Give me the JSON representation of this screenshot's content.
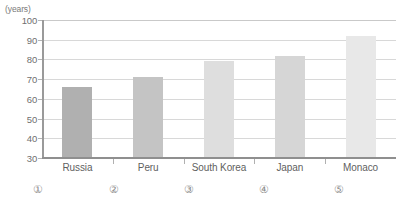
{
  "chart_data": {
    "type": "bar",
    "title": "",
    "xlabel": "",
    "ylabel": "",
    "unit_label": "(years)",
    "categories": [
      "Russia",
      "Peru",
      "South Korea",
      "Japan",
      "Monaco"
    ],
    "values": [
      66,
      71,
      79,
      82,
      92
    ],
    "ylim": [
      30,
      100
    ],
    "yticks": [
      100,
      90,
      80,
      70,
      60,
      50,
      40,
      30
    ],
    "ytick_labels": [
      "100",
      "90",
      "80",
      "70",
      "60",
      "50",
      "40",
      "30"
    ],
    "grid": true,
    "legend": "none",
    "bar_colors": [
      "#b0b0b0",
      "#c4c4c4",
      "#dedede",
      "#d6d6d6",
      "#e8e8e8"
    ]
  },
  "choices": {
    "items": [
      {
        "label": "①"
      },
      {
        "label": "②"
      },
      {
        "label": "③"
      },
      {
        "label": "④"
      },
      {
        "label": "⑤"
      }
    ]
  }
}
